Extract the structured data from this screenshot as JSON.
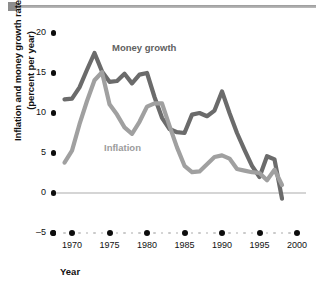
{
  "figure": {
    "ylabel_line1": "Inflation and money growth rate",
    "ylabel_line2": "(percent per year)",
    "xlabel": "Year",
    "series_label_money": "Money growth",
    "series_label_inflation": "Inflation",
    "y_ticks": [
      "20",
      "15",
      "10",
      "5",
      "0",
      "-5"
    ],
    "x_ticks": [
      "1970",
      "1975",
      "1980",
      "1985",
      "1990",
      "1995",
      "2000"
    ],
    "color_money": "#6b6b6b",
    "color_inflation": "#a0a0a0",
    "color_zero_line": "#d5d5d5",
    "color_tick_dot": "#0d0d0d"
  },
  "chart_data": {
    "type": "line",
    "title": "",
    "xlabel": "Year",
    "ylabel": "Inflation and money growth rate (percent per year)",
    "xlim": [
      1968.5,
      2000.5
    ],
    "ylim": [
      -5,
      20
    ],
    "yticks": [
      -5,
      0,
      5,
      10,
      15,
      20
    ],
    "xticks": [
      1970,
      1975,
      1980,
      1985,
      1990,
      1995,
      2000
    ],
    "grid": false,
    "legend": "inline-annotations",
    "annotations": [
      {
        "text": "Money growth",
        "series": "Money growth",
        "x": 1974.5,
        "y": 16.8
      },
      {
        "text": "Inflation",
        "series": "Inflation",
        "x": 1977.0,
        "y": 4.2
      }
    ],
    "series": [
      {
        "name": "Money growth",
        "color": "#6b6b6b",
        "x": [
          1969,
          1970,
          1971,
          1972,
          1973,
          1974,
          1975,
          1976,
          1977,
          1978,
          1979,
          1980,
          1981,
          1982,
          1983,
          1984,
          1985,
          1986,
          1987,
          1988,
          1989,
          1990,
          1991,
          1992,
          1993,
          1994,
          1995,
          1996,
          1997,
          1998
        ],
        "values": [
          11.7,
          11.8,
          13.2,
          15.4,
          17.5,
          15.2,
          13.9,
          14.0,
          14.9,
          13.7,
          14.8,
          15.0,
          12.0,
          9.4,
          8.0,
          7.6,
          7.5,
          9.8,
          10.0,
          9.6,
          10.3,
          12.7,
          10.0,
          7.5,
          5.4,
          3.4,
          2.0,
          4.6,
          4.2,
          -0.7
        ]
      },
      {
        "name": "Inflation",
        "color": "#a0a0a0",
        "x": [
          1969,
          1970,
          1971,
          1972,
          1973,
          1974,
          1975,
          1976,
          1977,
          1978,
          1979,
          1980,
          1981,
          1982,
          1983,
          1984,
          1985,
          1986,
          1987,
          1988,
          1989,
          1990,
          1991,
          1992,
          1993,
          1994,
          1995,
          1996,
          1997,
          1998
        ],
        "values": [
          3.8,
          5.3,
          8.6,
          11.5,
          14.1,
          15.1,
          11.1,
          9.8,
          8.2,
          7.4,
          8.9,
          10.8,
          11.2,
          11.2,
          8.4,
          5.7,
          3.4,
          2.6,
          2.7,
          3.6,
          4.5,
          4.7,
          4.3,
          3.0,
          2.8,
          2.6,
          2.5,
          1.6,
          2.9,
          1.0
        ]
      }
    ]
  }
}
